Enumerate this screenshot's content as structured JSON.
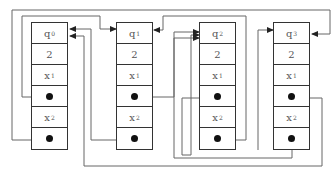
{
  "diagram": {
    "type": "linked-node-structure",
    "line_color": "#666666",
    "box_border_color": "#333333",
    "nodes": [
      {
        "id": "q0",
        "fields": [
          {
            "kind": "label",
            "base": "q",
            "sub": "0"
          },
          {
            "kind": "value",
            "text": "2"
          },
          {
            "kind": "label",
            "base": "x",
            "sub": "1"
          },
          {
            "kind": "pointer"
          },
          {
            "kind": "label",
            "base": "x",
            "sub": "2"
          },
          {
            "kind": "pointer"
          }
        ]
      },
      {
        "id": "q1",
        "fields": [
          {
            "kind": "label",
            "base": "q",
            "sub": "1"
          },
          {
            "kind": "value",
            "text": "2"
          },
          {
            "kind": "label",
            "base": "x",
            "sub": "1"
          },
          {
            "kind": "pointer"
          },
          {
            "kind": "label",
            "base": "x",
            "sub": "2"
          },
          {
            "kind": "pointer"
          }
        ]
      },
      {
        "id": "q2",
        "fields": [
          {
            "kind": "label",
            "base": "q",
            "sub": "2"
          },
          {
            "kind": "value",
            "text": "2"
          },
          {
            "kind": "label",
            "base": "x",
            "sub": "1"
          },
          {
            "kind": "pointer"
          },
          {
            "kind": "label",
            "base": "x",
            "sub": "2"
          },
          {
            "kind": "pointer"
          }
        ]
      },
      {
        "id": "q3",
        "fields": [
          {
            "kind": "label",
            "base": "q",
            "sub": "3"
          },
          {
            "kind": "value",
            "text": "2"
          },
          {
            "kind": "label",
            "base": "x",
            "sub": "1"
          },
          {
            "kind": "pointer"
          },
          {
            "kind": "label",
            "base": "x",
            "sub": "2"
          },
          {
            "kind": "pointer"
          }
        ]
      }
    ],
    "edges": [
      {
        "from": "q0.x1-pointer",
        "to": "q1"
      },
      {
        "from": "q0.x2-pointer",
        "to": "q3"
      },
      {
        "from": "q1.x1-pointer",
        "to": "q2"
      },
      {
        "from": "q1.x2-pointer",
        "to": "q0"
      },
      {
        "from": "q2.x1-pointer",
        "to": "q2"
      },
      {
        "from": "q2.x2-pointer",
        "to": "q1"
      },
      {
        "from": "q3.x1-pointer",
        "to": "q0"
      },
      {
        "from": "q3.x2-pointer",
        "to": "q2"
      }
    ]
  }
}
